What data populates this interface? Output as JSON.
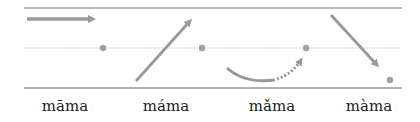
{
  "diagram": {
    "colors": {
      "line": "#9a9a9a",
      "arrow": "#999999",
      "dot": "#a0a0a0",
      "text": "#222222"
    },
    "tones": [
      {
        "syllable": "māma",
        "contour": "high-level"
      },
      {
        "syllable": "máma",
        "contour": "rising"
      },
      {
        "syllable": "mǎma",
        "contour": "dipping"
      },
      {
        "syllable": "màma",
        "contour": "falling"
      }
    ]
  }
}
